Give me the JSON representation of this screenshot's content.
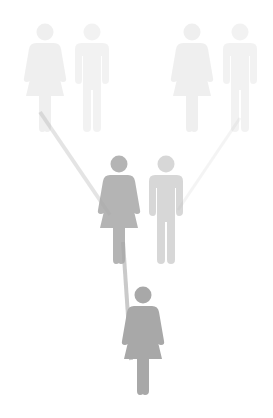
{
  "diagram": {
    "type": "pedigree",
    "background": "#ffffff",
    "figure_color": "#a8a8a8",
    "generations": [
      {
        "level": "grandparents",
        "opacity": 0.18,
        "people": [
          {
            "id": "gm1",
            "sex": "female",
            "x": 45,
            "y": 22,
            "scale": 1.0
          },
          {
            "id": "gf1",
            "sex": "male",
            "x": 92,
            "y": 22,
            "scale": 1.0
          },
          {
            "id": "gm2",
            "sex": "female",
            "x": 192,
            "y": 22,
            "scale": 1.0
          },
          {
            "id": "gf2",
            "sex": "male",
            "x": 240,
            "y": 22,
            "scale": 1.0
          }
        ]
      },
      {
        "level": "parents",
        "opacity": [
          0.85,
          0.45
        ],
        "people": [
          {
            "id": "mother",
            "sex": "female",
            "x": 119,
            "y": 154,
            "scale": 1.0
          },
          {
            "id": "father",
            "sex": "male",
            "x": 166,
            "y": 154,
            "scale": 1.0
          }
        ]
      },
      {
        "level": "child",
        "opacity": 1.0,
        "people": [
          {
            "id": "child",
            "sex": "female",
            "x": 143,
            "y": 285,
            "scale": 1.0
          }
        ]
      }
    ],
    "links": [
      {
        "from": "gm1",
        "to": "mother",
        "opacity": 0.3
      },
      {
        "from": "gf2",
        "to": "father",
        "opacity": 0.12
      },
      {
        "from": "mother",
        "to": "child",
        "opacity": 0.6
      }
    ]
  }
}
